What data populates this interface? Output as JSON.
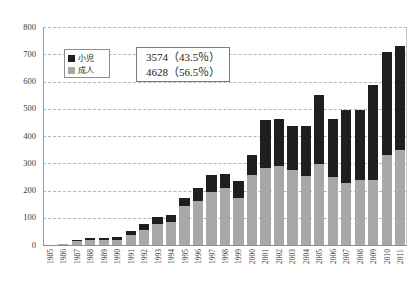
{
  "chart_data": {
    "type": "bar",
    "subtype": "stacked-bar",
    "title": "",
    "xlabel": "",
    "ylabel": "",
    "ylim": [
      0,
      800
    ],
    "ytick_step": 100,
    "ytick_labels": [
      "0",
      "100",
      "200",
      "300",
      "400",
      "500",
      "600",
      "700",
      "800"
    ],
    "grid": true,
    "grid_style": "dashed-horizontal",
    "legend_position": "inside-upper-left",
    "categories": [
      "1985",
      "1986",
      "1987",
      "1988",
      "1989",
      "1990",
      "1991",
      "1992",
      "1993",
      "1994",
      "1995",
      "1996",
      "1997",
      "1998",
      "1999",
      "2000",
      "2001",
      "2002",
      "2003",
      "2004",
      "2005",
      "2006",
      "2007",
      "2008",
      "2009",
      "2010",
      "2011"
    ],
    "series": [
      {
        "name": "成人",
        "color": "#a8a8a8",
        "values": [
          0,
          2,
          14,
          18,
          18,
          20,
          36,
          56,
          76,
          84,
          142,
          160,
          196,
          208,
          172,
          258,
          282,
          290,
          276,
          252,
          298,
          248,
          226,
          238,
          240,
          330,
          348
        ]
      },
      {
        "name": "小児",
        "color": "#1f1f1f",
        "values": [
          0,
          0,
          4,
          6,
          6,
          8,
          14,
          22,
          26,
          28,
          30,
          50,
          62,
          54,
          64,
          72,
          178,
          172,
          160,
          184,
          252,
          216,
          268,
          256,
          348,
          380,
          382
        ]
      }
    ],
    "totals": [
      0,
      2,
      18,
      24,
      24,
      28,
      50,
      78,
      102,
      112,
      172,
      210,
      258,
      262,
      236,
      330,
      460,
      462,
      436,
      436,
      550,
      464,
      494,
      494,
      588,
      710,
      730
    ],
    "annotation": {
      "line1": "3574（43.5％）",
      "line2": "4628（56.5％）"
    }
  },
  "legend": {
    "items": [
      {
        "label": "小児",
        "color": "#1f1f1f"
      },
      {
        "label": "成人",
        "color": "#a8a8a8"
      }
    ]
  }
}
